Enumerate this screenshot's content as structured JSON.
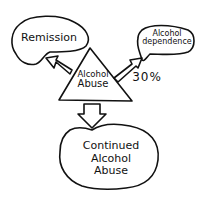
{
  "diagram": {
    "center": {
      "line1": "Alcohol",
      "line2": "Abuse"
    },
    "remission": {
      "label": "Remission"
    },
    "dependence": {
      "line1": "Alcohol",
      "line2": "dependence"
    },
    "dependence_rate": "30%",
    "continued": {
      "line1": "Continued",
      "line2": "Alcohol",
      "line3": "Abuse"
    }
  },
  "colors": {
    "stroke": "#111111",
    "background": "#ffffff"
  }
}
